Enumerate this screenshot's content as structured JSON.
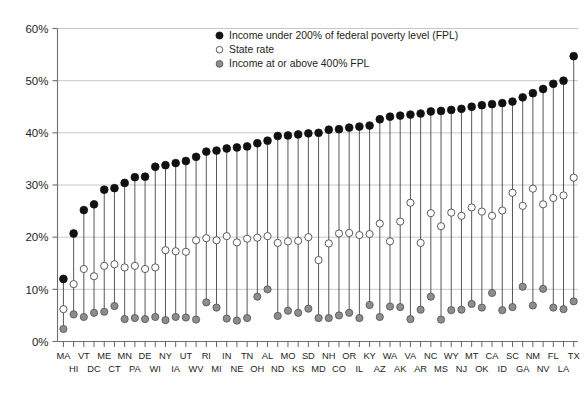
{
  "chart_data": {
    "type": "scatter",
    "title": "",
    "subtitle": "",
    "xlabel": "",
    "ylabel": "",
    "ylim": [
      0,
      60
    ],
    "yticks": [
      0,
      10,
      20,
      30,
      40,
      50,
      60
    ],
    "ytick_labels": [
      "0%",
      "10%",
      "20%",
      "30%",
      "40%",
      "50%",
      "60%"
    ],
    "grid": true,
    "legend_position": "top-center",
    "legend": [
      {
        "key": "poor",
        "label": "Income under 200% of federal poverty level (FPL)",
        "marker": "filled-circle",
        "color": "#111111"
      },
      {
        "key": "state",
        "label": "State rate",
        "marker": "open-circle",
        "color": "#ffffff"
      },
      {
        "key": "rich",
        "label": "Income at or above 400% FPL",
        "marker": "gray-circle",
        "color": "#8d8d8d"
      }
    ],
    "categories": [
      "MA",
      "HI",
      "VT",
      "DC",
      "ME",
      "CT",
      "MN",
      "PA",
      "DE",
      "WI",
      "NY",
      "IA",
      "UT",
      "WV",
      "RI",
      "MI",
      "IN",
      "NE",
      "TN",
      "OH",
      "AL",
      "ND",
      "MO",
      "KS",
      "SD",
      "MD",
      "NH",
      "CO",
      "OR",
      "IL",
      "KY",
      "AZ",
      "WA",
      "AK",
      "VA",
      "AR",
      "NC",
      "MS",
      "WY",
      "NJ",
      "MT",
      "OK",
      "CA",
      "ID",
      "SC",
      "GA",
      "NM",
      "NV",
      "FL",
      "LA",
      "TX"
    ],
    "series": [
      {
        "name": "Income under 200% of federal poverty level (FPL)",
        "key": "poor",
        "values": [
          12.0,
          20.7,
          25.2,
          26.3,
          29.1,
          29.4,
          30.4,
          31.5,
          31.6,
          33.5,
          33.8,
          34.2,
          34.6,
          35.4,
          36.4,
          36.6,
          37.0,
          37.2,
          37.4,
          38.0,
          38.5,
          39.4,
          39.5,
          39.7,
          39.9,
          40.0,
          40.6,
          40.7,
          41.0,
          41.2,
          41.4,
          42.6,
          43.1,
          43.3,
          43.5,
          43.7,
          44.1,
          44.2,
          44.4,
          44.6,
          45.0,
          45.3,
          45.5,
          45.7,
          46.0,
          46.8,
          47.6,
          48.4,
          49.4,
          50.0,
          54.7
        ]
      },
      {
        "name": "State rate",
        "key": "state",
        "values": [
          6.2,
          11.0,
          13.9,
          12.5,
          14.5,
          14.8,
          14.2,
          14.5,
          13.9,
          14.2,
          17.5,
          17.3,
          17.2,
          19.4,
          19.8,
          19.4,
          20.2,
          19.0,
          19.7,
          19.9,
          20.2,
          18.9,
          19.2,
          19.3,
          20.0,
          15.6,
          18.8,
          20.7,
          20.8,
          20.4,
          20.6,
          22.6,
          19.2,
          23.0,
          26.6,
          18.9,
          24.6,
          22.1,
          24.7,
          24.1,
          25.7,
          24.9,
          24.1,
          25.1,
          28.5,
          26.0,
          29.3,
          26.3,
          27.5,
          28.0,
          31.4
        ]
      },
      {
        "name": "Income at or above 400% FPL",
        "key": "rich",
        "values": [
          2.4,
          5.2,
          4.7,
          5.5,
          5.7,
          6.8,
          4.3,
          4.5,
          4.3,
          4.7,
          4.1,
          4.7,
          4.6,
          4.2,
          7.5,
          6.5,
          4.4,
          4.0,
          4.5,
          8.6,
          10.0,
          4.9,
          5.9,
          5.5,
          6.3,
          4.5,
          4.5,
          5.0,
          5.5,
          4.5,
          7.0,
          4.7,
          6.7,
          6.6,
          4.3,
          6.1,
          8.6,
          4.2,
          6.0,
          6.1,
          7.2,
          6.5,
          9.3,
          6.0,
          6.6,
          10.5,
          6.9,
          10.1,
          6.5,
          6.2,
          7.7
        ]
      }
    ]
  }
}
